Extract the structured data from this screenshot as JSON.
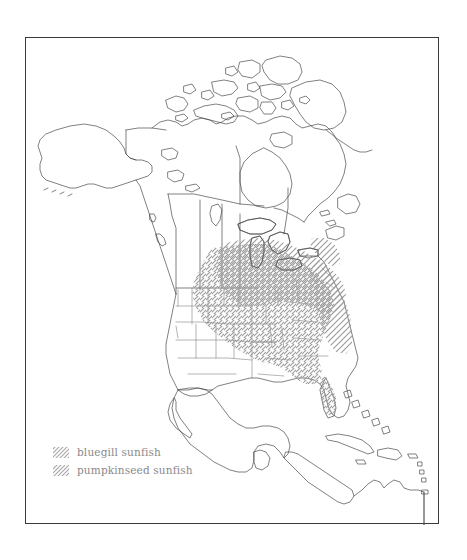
{
  "figure": {
    "type": "range-map",
    "region": "North America",
    "frame": {
      "color": "#3a3a3a",
      "x": 25,
      "y": 37,
      "width": 414,
      "height": 487
    }
  },
  "legend": {
    "position": "lower-left",
    "entries": [
      {
        "label": "bluegill sunfish",
        "pattern": "forward-hatch",
        "pattern_direction": "/",
        "color": "#9a9a9a"
      },
      {
        "label": "pumpkinseed sunfish",
        "pattern": "backward-hatch",
        "pattern_direction": "\\",
        "color": "#9a9a9a"
      }
    ]
  },
  "map": {
    "line_color": "#4a4a4a",
    "fill_color": "#ffffff",
    "features": [
      "alaska",
      "canada",
      "canadian-arctic-archipelago",
      "greenland-edge",
      "united-states",
      "us-state-boundaries",
      "mexico",
      "central-america",
      "cuba",
      "hispaniola",
      "bahamas",
      "lesser-antilles",
      "northern-south-america"
    ],
    "ranges": [
      {
        "species": "bluegill sunfish",
        "pattern": "forward-hatch",
        "extent": "central and eastern United States, west to the Great Plains and Texas, south through Florida, north to the Great Lakes"
      },
      {
        "species": "pumpkinseed sunfish",
        "pattern": "backward-hatch",
        "extent": "Great Lakes region, upper Midwest, Northeastern United States, southeastern Canada and the Atlantic seaboard"
      }
    ],
    "overlap_note": "crosshatched area indicates overlap of both species"
  }
}
